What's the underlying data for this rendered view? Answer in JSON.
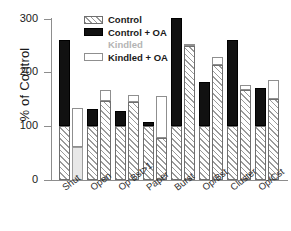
{
  "chart_data": {
    "type": "bar",
    "title": "",
    "subtitle": "",
    "xlabel": "",
    "ylabel": "% of Control",
    "ylim": [
      0,
      300
    ],
    "yticks": [
      0,
      100,
      200,
      300
    ],
    "ytick_labels": [
      "0",
      "100",
      "200",
      "300"
    ],
    "grid": false,
    "legend_position": "top-center",
    "categories": [
      "Shut",
      "Open",
      "Op Bst>1",
      "Paper",
      "Burst",
      "Op/Bst",
      "Cluster",
      "Op/Cst"
    ],
    "series": [
      {
        "name": "Control",
        "values": [
          100,
          100,
          100,
          100,
          100,
          100,
          100,
          100
        ]
      },
      {
        "name": "Control + OA",
        "values": [
          260,
          133,
          129,
          108,
          301,
          183,
          261,
          172
        ]
      },
      {
        "name": "Kindled",
        "values": [
          62,
          148,
          146,
          78,
          250,
          214,
          168,
          151
        ]
      },
      {
        "name": "Kindled + OA",
        "values": [
          135,
          168,
          159,
          157,
          250,
          229,
          177,
          187
        ]
      }
    ]
  },
  "legend": {
    "items": [
      {
        "label": "Control",
        "swatch": "hatched",
        "color": "#9a9a9a"
      },
      {
        "label": "Control + OA",
        "swatch": "solid",
        "color": "#111111"
      },
      {
        "label": "Kindled",
        "swatch": "none",
        "color": "#e8e8e8"
      },
      {
        "label": "Kindled + OA",
        "swatch": "outline",
        "color": "#ffffff"
      }
    ]
  },
  "axes": {
    "y_title": "% of Control",
    "y_tick_labels": [
      "300",
      "200",
      "100",
      "0"
    ],
    "x_tick_labels": [
      "Shut",
      "Open",
      "Op Bst>1",
      "Paper",
      "Burst",
      "Op/Bst",
      "Cluster",
      "Op/Cst"
    ]
  }
}
